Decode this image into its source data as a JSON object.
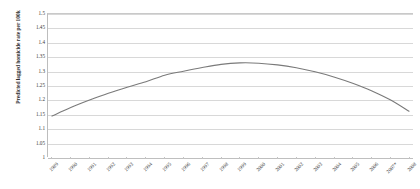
{
  "chart_data": {
    "type": "line",
    "title": "",
    "xlabel": "",
    "ylabel": "Predicted lagged homicide rate per 100k",
    "categories": [
      "1989",
      "1990",
      "1991",
      "1992",
      "1993",
      "1994",
      "1995",
      "1996",
      "1997",
      "1998",
      "1999",
      "2000",
      "2001",
      "2002",
      "2003",
      "2004",
      "2005",
      "2006",
      "2007*",
      "2008"
    ],
    "values": [
      1.143,
      1.173,
      1.199,
      1.223,
      1.244,
      1.263,
      1.286,
      1.3,
      1.313,
      1.324,
      1.329,
      1.328,
      1.322,
      1.312,
      1.298,
      1.28,
      1.258,
      1.232,
      1.2,
      1.16
    ],
    "series": [
      {
        "name": "Predicted lagged homicide rate per 100k",
        "values": [
          1.143,
          1.173,
          1.199,
          1.223,
          1.244,
          1.263,
          1.286,
          1.3,
          1.313,
          1.324,
          1.329,
          1.328,
          1.322,
          1.312,
          1.298,
          1.28,
          1.258,
          1.232,
          1.2,
          1.16
        ],
        "color": "#7a7a7a"
      }
    ],
    "ylim": [
      1,
      1.5
    ],
    "yticks": [
      "1",
      "1.05",
      "1.1",
      "1.15",
      "1.2",
      "1.25",
      "1.3",
      "1.35",
      "1.4",
      "1.45",
      "1.5"
    ],
    "ytick_values": [
      1,
      1.05,
      1.1,
      1.15,
      1.2,
      1.25,
      1.3,
      1.35,
      1.4,
      1.45,
      1.5
    ],
    "grid": true,
    "legend": "none",
    "line_color": "#7a7a7a",
    "gridline_color": "#d8d8d8",
    "axis_color": "#bdbdbd",
    "background_color": "#ffffff"
  }
}
